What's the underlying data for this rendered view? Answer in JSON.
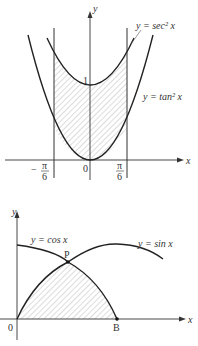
{
  "figure_top": {
    "axis_x_label": "x",
    "axis_y_label": "y",
    "curve_upper_label": "y = sec² x",
    "curve_lower_label": "y = tan² x",
    "y_intercept_label": "1",
    "origin_label": "0",
    "left_bound_num": "π",
    "left_bound_sign": "−",
    "left_bound_den": "6",
    "right_bound_num": "π",
    "right_bound_den": "6",
    "shaded_region": "between y = sec² x and y = tan² x for −π/6 ≤ x ≤ π/6"
  },
  "figure_bottom": {
    "axis_x_label": "x",
    "axis_y_label": "y",
    "curve_cos_label": "y = cos x",
    "curve_sin_label": "y = sin x",
    "intersection_label": "P",
    "point_b_label": "B",
    "origin_label": "0",
    "shaded_region": "under y = sin x from 0 to P and under y = cos x from P to B"
  },
  "colors": {
    "stroke": "#222222",
    "hatch": "#888888",
    "background": "#ffffff"
  }
}
